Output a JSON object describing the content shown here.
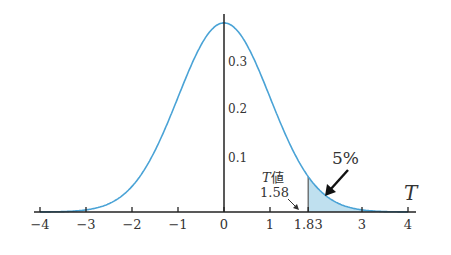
{
  "chart_data": {
    "type": "area",
    "title": "",
    "xlabel": "T",
    "ylabel": "",
    "xlim": [
      -4,
      4
    ],
    "ylim": [
      0,
      0.4
    ],
    "x_ticks": [
      -4,
      -3,
      -2,
      -1,
      0,
      1,
      1.83,
      3,
      4
    ],
    "x_tick_labels": [
      "−4",
      "−3",
      "−2",
      "−1",
      "0",
      "1",
      "1.83",
      "3",
      "4"
    ],
    "y_ticks": [
      0.1,
      0.2,
      0.3
    ],
    "y_tick_labels": [
      "0.1",
      "0.2",
      "0.3"
    ],
    "grid": false,
    "curve": {
      "name": "density",
      "color": "#4aa3d6",
      "peak": 0.399,
      "x": [
        -4,
        -3,
        -2,
        -1,
        0,
        1,
        2,
        3,
        4
      ],
      "y": [
        0.0001,
        0.0044,
        0.054,
        0.242,
        0.399,
        0.242,
        0.054,
        0.0044,
        0.0001
      ]
    },
    "shaded_region": {
      "from": 1.83,
      "to": 4,
      "fill": "#bfe0ef",
      "label": "5%"
    },
    "annotations": [
      {
        "text": "T値",
        "sub": "1.58",
        "points_to_x": 1.58
      },
      {
        "text": "5%",
        "points_to": "shaded tail"
      }
    ]
  },
  "labels": {
    "axis_name": "T",
    "t_value_label": "値",
    "t_value_italic": "T",
    "t_value": "1.58",
    "percent": "5%",
    "x_ticks": [
      "−4",
      "−3",
      "−2",
      "−1",
      "0",
      "1",
      "1.83",
      "3",
      "4"
    ],
    "y_ticks": [
      "0.1",
      "0.2",
      "0.3"
    ]
  }
}
